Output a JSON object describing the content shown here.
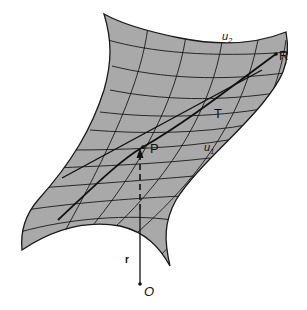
{
  "figure": {
    "colors": {
      "surface": "#a9a9a9",
      "lines": "#1a1a1a",
      "background": "#ffffff"
    },
    "labels": {
      "u2": "u",
      "u2_sub": "2",
      "u1": "u",
      "u1_sub": "1",
      "P": "P",
      "T": "T",
      "R": "R",
      "O": "O",
      "r": "r"
    },
    "elements": [
      "surface patch with coordinate grid",
      "curve from P to R",
      "tangent line T at P",
      "position vector r from origin O to point P"
    ]
  }
}
